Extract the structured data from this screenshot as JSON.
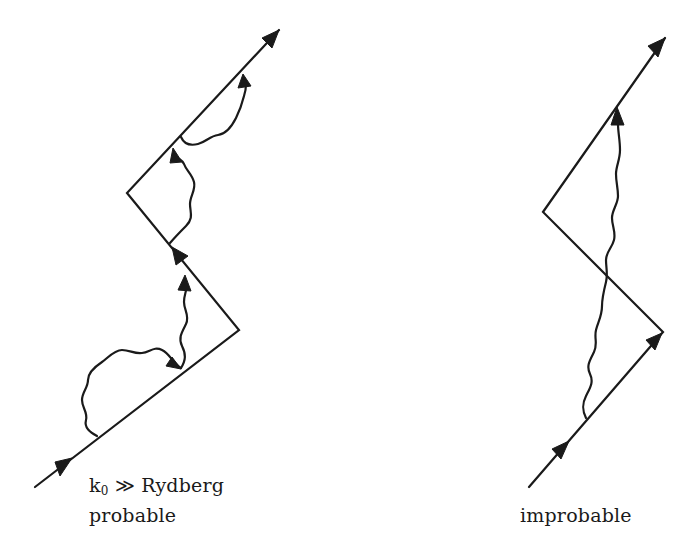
{
  "figure": {
    "left_diagram": {
      "caption_line1_prefix": "k",
      "caption_line1_subscript": "0",
      "caption_line1_suffix": " ≫ Rydberg",
      "caption_line2": "probable"
    },
    "right_diagram": {
      "caption": "improbable"
    }
  },
  "colors": {
    "ink": "#1a1a1a",
    "background": "#ffffff"
  }
}
